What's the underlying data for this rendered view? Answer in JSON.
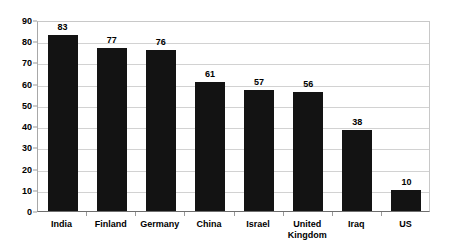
{
  "chart_data": {
    "type": "bar",
    "title": "",
    "subtitle": "",
    "xlabel": "",
    "ylabel": "",
    "ylim": [
      0,
      90
    ],
    "yticks": [
      0,
      10,
      20,
      30,
      40,
      50,
      60,
      70,
      80,
      90
    ],
    "ytick_labels": [
      "0",
      "10",
      "20",
      "30",
      "40",
      "50",
      "60",
      "70",
      "80",
      "90"
    ],
    "grid": true,
    "legend": false,
    "legend_position": "none",
    "orientation": "vertical",
    "bar_color": "#131313",
    "gridline_color": "#d2d2d2",
    "axis_color": "#6e6e6e",
    "background_color": "#ffffff",
    "show_value_labels": true,
    "categories": [
      "India",
      "Finland",
      "Germany",
      "China",
      "Israel",
      "United\nKingdom",
      "Iraq",
      "US"
    ],
    "values": [
      83,
      77,
      76,
      61,
      57,
      56,
      38,
      10
    ],
    "value_labels": [
      "83",
      "77",
      "76",
      "61",
      "57",
      "56",
      "38",
      "10"
    ]
  }
}
